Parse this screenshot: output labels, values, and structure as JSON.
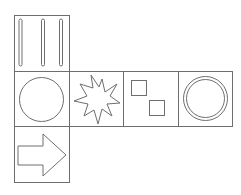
{
  "diagram": {
    "title": "",
    "stroke_color": "#6e6e6e",
    "faces": [
      {
        "id": "top",
        "symbol": "three-vertical-bars",
        "position": "row1-col1"
      },
      {
        "id": "left",
        "symbol": "circle",
        "position": "row2-col1"
      },
      {
        "id": "center",
        "symbol": "starburst",
        "position": "row2-col2"
      },
      {
        "id": "right",
        "symbol": "two-squares",
        "position": "row2-col3"
      },
      {
        "id": "far-right",
        "symbol": "double-circle",
        "position": "row2-col4"
      },
      {
        "id": "bottom",
        "symbol": "right-arrow",
        "position": "row3-col1"
      }
    ]
  }
}
